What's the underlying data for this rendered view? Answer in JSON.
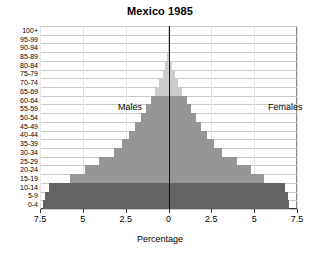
{
  "chart_data": {
    "type": "bar",
    "subtype": "population-pyramid",
    "title": "Mexico 1985",
    "xlabel": "Percentage",
    "ylabel": "",
    "xlim": [
      -7.5,
      7.5
    ],
    "xticks": [
      "7.5",
      "5",
      "2.5",
      "0",
      "2.5",
      "5",
      "7.5"
    ],
    "xtick_values": [
      -7.5,
      -5,
      -2.5,
      0,
      2.5,
      5,
      7.5
    ],
    "grid": true,
    "legend_position": "inside-plot",
    "categories": [
      "0-4",
      "5-9",
      "10-14",
      "15-19",
      "20-24",
      "25-29",
      "30-34",
      "35-39",
      "40-44",
      "45-49",
      "50-54",
      "55-59",
      "60-64",
      "65-69",
      "70-74",
      "75-79",
      "80-84",
      "85-89",
      "90-94",
      "95-99",
      "100+"
    ],
    "series": [
      {
        "name": "Males",
        "side": "left",
        "values": [
          7.35,
          7.2,
          6.95,
          5.75,
          4.85,
          4.05,
          3.2,
          2.7,
          2.3,
          1.95,
          1.6,
          1.3,
          1.05,
          0.78,
          0.55,
          0.35,
          0.18,
          0.07,
          0.03,
          0.01,
          0.005
        ]
      },
      {
        "name": "Females",
        "side": "right",
        "values": [
          7.05,
          6.95,
          6.8,
          5.6,
          4.8,
          4.0,
          3.15,
          2.65,
          2.25,
          1.9,
          1.58,
          1.3,
          1.08,
          0.8,
          0.58,
          0.38,
          0.2,
          0.08,
          0.03,
          0.012,
          0.005
        ]
      }
    ],
    "band_colors": {
      "youth_0_14": "#636363",
      "working_15_64": "#969696",
      "elderly_65_plus": "#cccccc"
    },
    "band_assignment": [
      "youth_0_14",
      "youth_0_14",
      "youth_0_14",
      "working_15_64",
      "working_15_64",
      "working_15_64",
      "working_15_64",
      "working_15_64",
      "working_15_64",
      "working_15_64",
      "working_15_64",
      "working_15_64",
      "working_15_64",
      "elderly_65_plus",
      "elderly_65_plus",
      "elderly_65_plus",
      "elderly_65_plus",
      "elderly_65_plus",
      "elderly_65_plus",
      "elderly_65_plus",
      "elderly_65_plus"
    ],
    "annotations": [
      {
        "text": "Males",
        "name": "males-label"
      },
      {
        "text": "Females",
        "name": "females-label"
      }
    ]
  },
  "labels": {
    "males": "Males",
    "females": "Females",
    "x_axis_title": "Percentage",
    "title": "Mexico 1985"
  },
  "colors": {
    "axis": "#111111",
    "grid": "#c8c8c8",
    "border": "#4d4d4d",
    "background": "#ffffff",
    "text": "#000000"
  }
}
